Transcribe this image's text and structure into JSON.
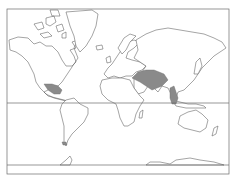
{
  "map": {
    "type": "world-outline",
    "projection": "mercator-like",
    "style": "black-and-white outline",
    "colors": {
      "background": "#ffffff",
      "coastline": "#5a5a5a",
      "highlight": "#8a8a8a",
      "frame": "#6a6a6a"
    },
    "reference_lines": [
      {
        "name": "equator",
        "y": 103
      },
      {
        "name": "southern-boundary",
        "y": 165
      }
    ],
    "highlighted_regions": [
      {
        "name": "Mesoamerica (Mexico / Central America)"
      },
      {
        "name": "Central Asia"
      },
      {
        "name": "Southeast Asia (Indochina / Malay Archipelago)"
      },
      {
        "name": "Southern tip of South America"
      }
    ]
  }
}
